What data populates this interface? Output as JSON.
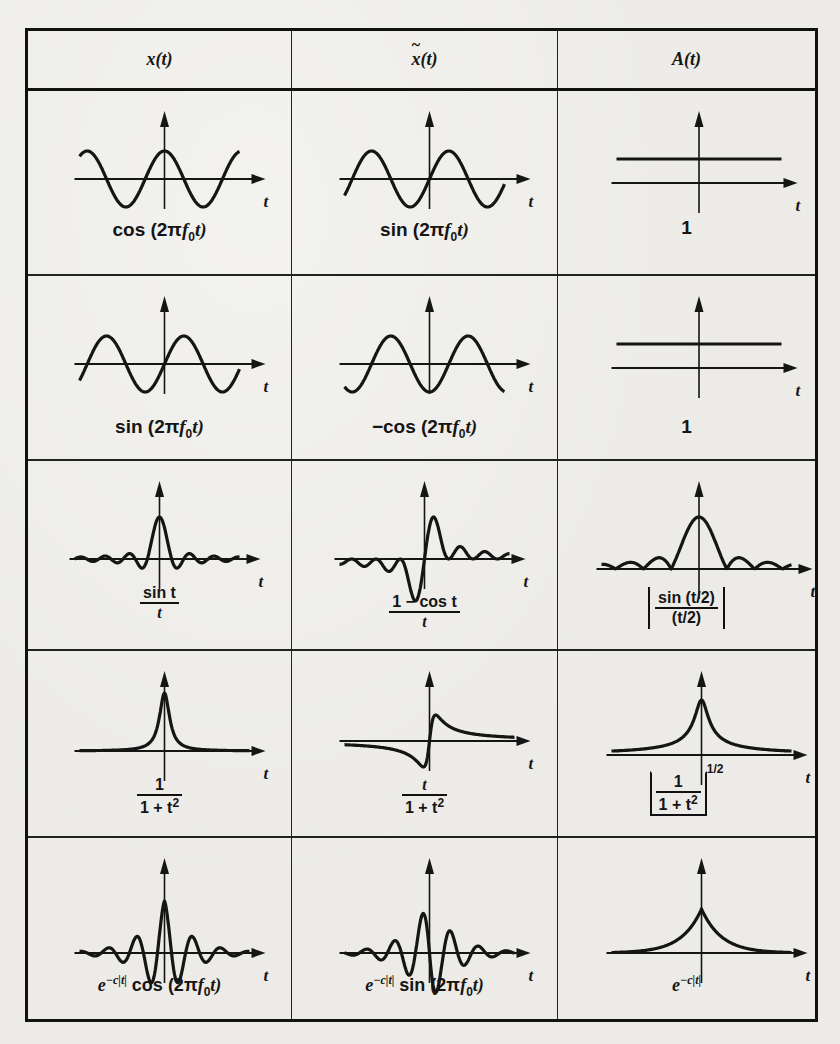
{
  "table": {
    "headers": [
      "x(t)",
      "x̃(t)",
      "A(t)"
    ],
    "header_parts": {
      "col1": {
        "fn": "x",
        "arg": "(t)"
      },
      "col2": {
        "fn": "x",
        "arg": "(t)",
        "accent": "tilde"
      },
      "col3": {
        "fn": "A",
        "arg": "(t)"
      }
    },
    "axis_label": "t",
    "rows": [
      {
        "x": {
          "caption": "cos (2πf₀t)",
          "pre": "cos (2π",
          "var": "f",
          "sub": "0",
          "post": "t)",
          "plot": "cos"
        },
        "xh": {
          "caption": "sin (2πf₀t)",
          "pre": "sin (2π",
          "var": "f",
          "sub": "0",
          "post": "t)",
          "plot": "sin"
        },
        "A": {
          "caption": "1",
          "plot": "const"
        }
      },
      {
        "x": {
          "caption": "sin (2πf₀t)",
          "pre": "sin (2π",
          "var": "f",
          "sub": "0",
          "post": "t)",
          "plot": "sin"
        },
        "xh": {
          "caption": "−cos (2πf₀t)",
          "pre": "−cos (2π",
          "var": "f",
          "sub": "0",
          "post": "t)",
          "plot": "negcos"
        },
        "A": {
          "caption": "1",
          "plot": "const"
        }
      },
      {
        "x": {
          "caption": "sin t / t",
          "num": "sin t",
          "den": "t",
          "plot": "sinc"
        },
        "xh": {
          "caption": "(1 − cos t) / t",
          "num": "1 − cos t",
          "den": "t",
          "plot": "onecos"
        },
        "A": {
          "caption": "|sin(t/2) / (t/2)|",
          "num": "sin (t/2)",
          "den": "(t/2)",
          "plot": "abssinc"
        }
      },
      {
        "x": {
          "caption": "1 / (1 + t²)",
          "num": "1",
          "den": "1 + t",
          "den_sup": "2",
          "plot": "lorentz"
        },
        "xh": {
          "caption": "t / (1 + t²)",
          "num": "t",
          "den": "1 + t",
          "den_sup": "2",
          "plot": "tlorentz"
        },
        "A": {
          "caption": "[1 / (1 + t²)]^(1/2)",
          "num": "1",
          "den": "1 + t",
          "den_sup": "2",
          "exp": "1/2",
          "plot": "sqrtlorentz"
        }
      },
      {
        "x": {
          "caption": "e^(−c|t|) cos (2πf₀t)",
          "base": "e",
          "exp": "−c|t|",
          "pre": " cos (2π",
          "var": "f",
          "sub": "0",
          "post": "t)",
          "plot": "dampcos"
        },
        "xh": {
          "caption": "e^(−c|t|) sin (2πf₀t)",
          "base": "e",
          "exp": "−c|t|",
          "pre": " sin (2π",
          "var": "f",
          "sub": "0",
          "post": "t)",
          "plot": "dampsin"
        },
        "A": {
          "caption": "e^(−c|t|)",
          "base": "e",
          "exp": "−c|t|",
          "plot": "expdecay"
        }
      }
    ]
  },
  "colors": {
    "ink": "#151515",
    "paper": "#ecebe7"
  }
}
